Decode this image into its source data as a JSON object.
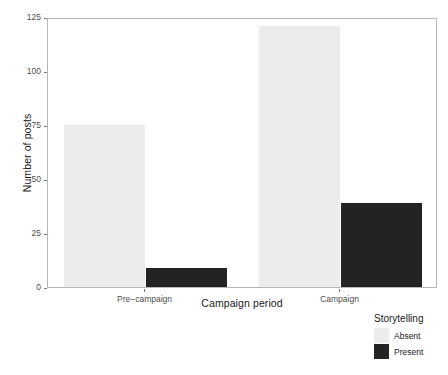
{
  "chart_data": {
    "type": "bar",
    "title": "",
    "subtitle": "",
    "xlabel": "Campaign period",
    "ylabel": "Number of posts",
    "categories": [
      "Pre−campaign",
      "Campaign"
    ],
    "series": [
      {
        "name": "Absent",
        "values": [
          75,
          121
        ],
        "color": "#ececec"
      },
      {
        "name": "Present",
        "values": [
          9,
          39
        ],
        "color": "#232323"
      }
    ],
    "ylim": [
      0,
      125
    ],
    "yticks": [
      0,
      25,
      50,
      75,
      100,
      125
    ],
    "ytick_labels": [
      "0",
      "25",
      "50",
      "75",
      "100",
      "125"
    ],
    "grid": false,
    "legend": {
      "title": "Storytelling",
      "position": "bottom-right",
      "entries": [
        {
          "label": "Absent",
          "color": "#ececec"
        },
        {
          "label": "Present",
          "color": "#232323"
        }
      ]
    },
    "panel": {
      "background": "#ffffff",
      "border_color": "#b7b7b7",
      "axis_text_color": "#4d4d4d",
      "axis_title_color": "#1a1a1a"
    },
    "bar_layout": "stacked-side-by-side",
    "bars": [
      {
        "category": "Pre−campaign",
        "series": "Absent",
        "value": 75,
        "color": "#ececec"
      },
      {
        "category": "Pre−campaign",
        "series": "Present",
        "value": 9,
        "color": "#232323"
      },
      {
        "category": "Campaign",
        "series": "Absent",
        "value": 121,
        "color": "#ececec"
      },
      {
        "category": "Campaign",
        "series": "Present",
        "value": 39,
        "color": "#232323"
      }
    ]
  }
}
